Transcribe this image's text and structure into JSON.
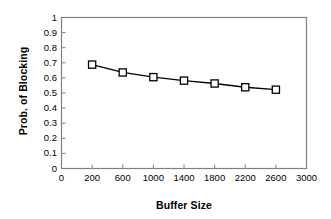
{
  "chart_data": {
    "type": "line",
    "title": "",
    "xlabel": "Buffer Size",
    "ylabel": "Prob. of Blocking",
    "x": [
      200,
      600,
      1000,
      1400,
      1800,
      2200,
      2600
    ],
    "values": [
      0.688,
      0.636,
      0.605,
      0.582,
      0.563,
      0.538,
      0.522
    ],
    "series": [
      {
        "name": "Prob. of Blocking",
        "values": [
          0.688,
          0.636,
          0.605,
          0.582,
          0.563,
          0.538,
          0.522
        ],
        "marker": "square-open",
        "color": "#000000"
      }
    ],
    "xlim": [
      0,
      3000
    ],
    "ylim": [
      0,
      1
    ],
    "xticks": [
      0,
      200,
      600,
      1000,
      1400,
      1800,
      2200,
      2600,
      3000
    ],
    "xtick_labels": [
      "0",
      "200",
      "600",
      "1000",
      "1400",
      "1800",
      "2200",
      "2600",
      "3000"
    ],
    "yticks": [
      0,
      0.1,
      0.2,
      0.3,
      0.4,
      0.5,
      0.6,
      0.7,
      0.8,
      0.9,
      1
    ],
    "ytick_labels": [
      "0",
      "0.1",
      "0.2",
      "0.3",
      "0.4",
      "0.5",
      "0.6",
      "0.7",
      "0.8",
      "0.9",
      "1"
    ],
    "grid": false,
    "legend": false,
    "legend_position": "none",
    "line_color": "#000000",
    "axis_color": "#808080",
    "background": "#ffffff"
  }
}
